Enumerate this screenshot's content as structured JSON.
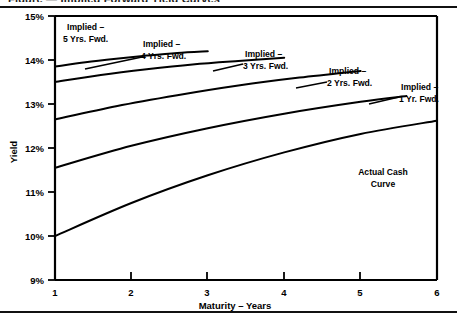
{
  "figure": {
    "clipped_caption": "Figure  —  Implied Forward Yield Curves",
    "top_rule": "horizontal-rule",
    "bottom_rule": "horizontal-rule"
  },
  "axes": {
    "y_label": "Yield",
    "x_label": "Maturity – Years",
    "y_ticks": [
      "9%",
      "10%",
      "11%",
      "12%",
      "13%",
      "14%",
      "15%"
    ],
    "x_ticks": [
      "1",
      "2",
      "3",
      "4",
      "5",
      "6"
    ]
  },
  "labels": {
    "implied5": {
      "line1": "Implied –",
      "line2": "5 Yrs. Fwd."
    },
    "implied4": {
      "line1": "Implied –",
      "line2": "4 Yrs. Fwd."
    },
    "implied3": {
      "line1": "Implied –",
      "line2": "3 Yrs. Fwd."
    },
    "implied2": {
      "line1": "Implied –",
      "line2": "2 Yrs. Fwd."
    },
    "implied1": {
      "line1": "Implied –",
      "line2": "1 Yr. Fwd."
    },
    "actual": {
      "line1": "Actual Cash",
      "line2": "Curve"
    }
  },
  "chart_data": {
    "type": "line",
    "title": "",
    "xlabel": "Maturity – Years",
    "ylabel": "Yield",
    "xlim": [
      1,
      6
    ],
    "ylim": [
      9,
      15
    ],
    "yunit": "percent",
    "ytick_values": [
      9,
      10,
      11,
      12,
      13,
      14,
      15
    ],
    "xtick_values": [
      1,
      2,
      3,
      4,
      5,
      6
    ],
    "grid": false,
    "legend": "inline-annotations",
    "series": [
      {
        "name": "Implied – 5 Yrs. Fwd.",
        "x": [
          1.0,
          1.4,
          1.8,
          2.2,
          2.6,
          3.0
        ],
        "values": [
          13.85,
          13.95,
          14.03,
          14.1,
          14.16,
          14.2
        ],
        "label_anchor": [
          1.15,
          14.75
        ]
      },
      {
        "name": "Implied – 4 Yrs. Fwd.",
        "x": [
          1.0,
          1.6,
          2.2,
          2.8,
          3.4,
          4.0
        ],
        "values": [
          13.5,
          13.66,
          13.79,
          13.9,
          13.98,
          14.05
        ],
        "label_anchor": [
          2.18,
          14.42
        ]
      },
      {
        "name": "Implied – 3 Yrs. Fwd.",
        "x": [
          1.0,
          1.8,
          2.6,
          3.4,
          4.2,
          5.0
        ],
        "values": [
          12.65,
          12.95,
          13.2,
          13.42,
          13.6,
          13.75
        ],
        "label_anchor": [
          3.3,
          13.95
        ]
      },
      {
        "name": "Implied – 2 Yrs. Fwd.",
        "x": [
          1.0,
          2.0,
          3.0,
          4.0,
          5.0,
          5.6
        ],
        "values": [
          11.55,
          12.05,
          12.45,
          12.78,
          13.05,
          13.18
        ],
        "label_anchor": [
          4.32,
          13.5
        ]
      },
      {
        "name": "Implied – 1 Yr. Fwd.",
        "x": [
          1.0,
          2.0,
          3.0,
          4.0,
          5.0,
          6.0
        ],
        "values": [
          10.0,
          10.75,
          11.38,
          11.9,
          12.32,
          12.62
        ],
        "label_anchor": [
          5.35,
          13.0
        ]
      }
    ],
    "annotations": [
      {
        "text": "Actual Cash Curve",
        "x": 5.05,
        "y": 11.35
      }
    ]
  }
}
